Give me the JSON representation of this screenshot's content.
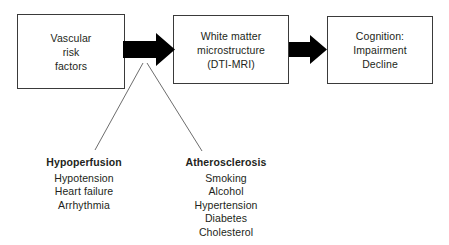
{
  "diagram": {
    "colors": {
      "background": "#ffffff",
      "box_border": "#3a3a3a",
      "text": "#231f20",
      "arrow": "#000000",
      "connector_line": "#6d6d6d"
    },
    "boxes": [
      {
        "id": "vascular-risk-factors",
        "lines": [
          "Vascular",
          "risk",
          "factors"
        ]
      },
      {
        "id": "white-matter",
        "lines": [
          "White matter",
          "microstructure",
          "(DTI-MRI)"
        ]
      },
      {
        "id": "cognition",
        "lines": [
          "Cognition:",
          "Impairment",
          "Decline"
        ]
      }
    ],
    "arrows": [
      {
        "id": "arrow-risk-to-whitematter",
        "from": "vascular-risk-factors",
        "to": "white-matter"
      },
      {
        "id": "arrow-whitematter-to-cognition",
        "from": "white-matter",
        "to": "cognition"
      }
    ],
    "groups": [
      {
        "id": "hypoperfusion",
        "heading": "Hypoperfusion",
        "items": [
          "Hypotension",
          "Heart failure",
          "Arrhythmia"
        ]
      },
      {
        "id": "atherosclerosis",
        "heading": "Atherosclerosis",
        "items": [
          "Smoking",
          "Alcohol",
          "Hypertension",
          "Diabetes",
          "Cholesterol"
        ]
      }
    ]
  }
}
